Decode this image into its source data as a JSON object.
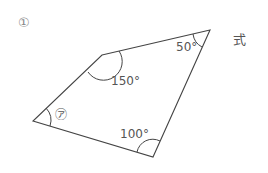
{
  "problem_number": "①",
  "formula_label": "式",
  "angles": {
    "top_left": "150°",
    "top_right": "50°",
    "bottom_right": "100°",
    "unknown": "㋐"
  },
  "colors": {
    "line": "#444444",
    "text": "#555555"
  }
}
